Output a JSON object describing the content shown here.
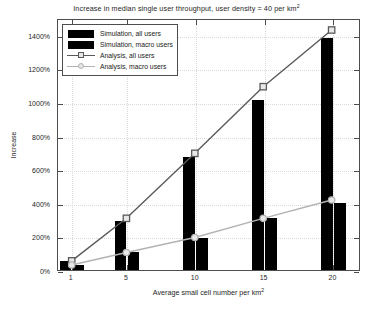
{
  "chart_data": {
    "type": "bar",
    "title": "Increase in median single user throughput, user density = 40 per km2",
    "title_main": "Increase in median single user throughput, user density = 40 per km",
    "title_sup": "2",
    "xlabel_main": "Average small cell number per km",
    "xlabel_sup": "2",
    "xlabel": "Average small cell number per km2",
    "ylabel": "Increase",
    "x": [
      1,
      5,
      10,
      15,
      20
    ],
    "categories": [
      "1",
      "5",
      "10",
      "15",
      "20"
    ],
    "xtick_labels": [
      "1",
      "5",
      "10",
      "15",
      "20"
    ],
    "ytick_labels": [
      "0%",
      "200%",
      "400%",
      "600%",
      "800%",
      "1000%",
      "1200%",
      "1400%"
    ],
    "ytick_values": [
      0,
      200,
      400,
      600,
      800,
      1000,
      1200,
      1400
    ],
    "xlim": [
      0,
      22
    ],
    "ylim": [
      0,
      1500
    ],
    "grid": true,
    "legend_position": "upper left",
    "series": [
      {
        "name": "Simulation, all users",
        "kind": "bar",
        "color": "#000000",
        "values": [
          55,
          290,
          670,
          1010,
          1380
        ]
      },
      {
        "name": "Simulation, macro users",
        "kind": "bar",
        "color": "#000000",
        "values": [
          30,
          110,
          190,
          310,
          400
        ]
      },
      {
        "name": "Analysis, all users",
        "kind": "line",
        "color": "#595959",
        "marker": "square",
        "values": [
          55,
          310,
          700,
          1100,
          1440
        ]
      },
      {
        "name": "Analysis, macro users",
        "kind": "line",
        "color": "#b3b3b3",
        "marker": "circle",
        "values": [
          30,
          105,
          195,
          310,
          420
        ]
      }
    ]
  },
  "legend": {
    "entries": [
      {
        "label": "Simulation, all users",
        "key": "filled-rect-black"
      },
      {
        "label": "Simulation, macro users",
        "key": "filled-rect-black"
      },
      {
        "label": "Analysis, all users",
        "key": "line-square-dark"
      },
      {
        "label": "Analysis, macro users",
        "key": "line-circle-gray"
      }
    ]
  },
  "colors": {
    "bar": "#000000",
    "analysis_all": "#595959",
    "analysis_macro": "#b3b3b3",
    "axis": "#4d4d4d",
    "grid": "#d9d9d9",
    "background": "#ffffff"
  }
}
